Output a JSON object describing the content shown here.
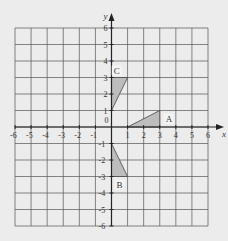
{
  "diagram": {
    "type": "coordinate-grid",
    "axes": {
      "x_label": "x",
      "y_label": "y",
      "origin_label": "0",
      "x_ticks": [
        "-6",
        "-5",
        "-4",
        "-3",
        "-2",
        "-1",
        "1",
        "2",
        "3",
        "4",
        "5",
        "6"
      ],
      "y_ticks": [
        "6",
        "5",
        "4",
        "3",
        "2",
        "1",
        "-1",
        "-2",
        "-3",
        "-4",
        "-5",
        "-6"
      ],
      "range": [
        -6,
        6
      ]
    },
    "shapes": [
      {
        "label": "A",
        "vertices": [
          [
            1,
            0
          ],
          [
            3,
            1
          ],
          [
            3,
            0
          ]
        ]
      },
      {
        "label": "B",
        "vertices": [
          [
            0,
            -1
          ],
          [
            1,
            -3
          ],
          [
            0,
            -3
          ]
        ]
      },
      {
        "label": "C",
        "vertices": [
          [
            0,
            1
          ],
          [
            1,
            3
          ],
          [
            0,
            3
          ]
        ]
      }
    ],
    "colors": {
      "background": "#ececec",
      "grid": "#555555",
      "axis": "#222222",
      "shape_fill": "#bdbdbd",
      "text": "#333333"
    }
  }
}
